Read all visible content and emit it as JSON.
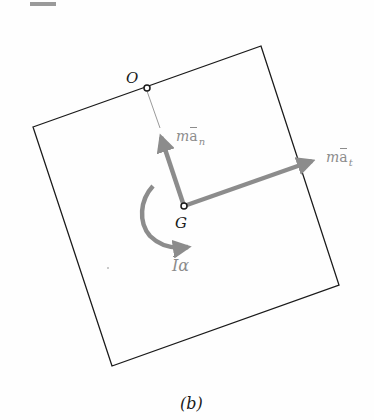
{
  "figure": {
    "caption": "(b)",
    "header_bar_color": "#9a9a9a"
  },
  "body": {
    "outline_color": "#1a1a1a",
    "corners": [
      [
        33,
        127
      ],
      [
        261,
        46
      ],
      [
        339,
        285
      ],
      [
        112,
        366
      ]
    ]
  },
  "points": {
    "O": {
      "label": "O",
      "x": 147,
      "y": 88
    },
    "G": {
      "label": "G",
      "x": 184,
      "y": 206
    }
  },
  "vectors": {
    "color": "#8c8c8c",
    "normal_inertia": {
      "m": "m",
      "a": "a",
      "sub": "n",
      "tip": [
        159,
        130
      ]
    },
    "tangential_inertia": {
      "m": "m",
      "a": "a",
      "sub": "t",
      "tip": [
        322,
        158
      ]
    },
    "inertia_couple": {
      "I": "I",
      "alpha": "α"
    }
  }
}
